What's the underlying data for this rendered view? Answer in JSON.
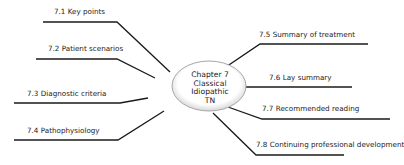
{
  "center": {
    "lines": [
      "Chapter 7",
      "Classical",
      "Idiopathic",
      "TN"
    ]
  },
  "branches": [
    {
      "label": "7.1 Key points"
    },
    {
      "label": "7.2 Patient scenarios"
    },
    {
      "label": "7.3 Diagnostic criteria"
    },
    {
      "label": "7.4 Pathophysiology"
    },
    {
      "label": "7.5 Summary of treatment"
    },
    {
      "label": "7.6 Lay summary"
    },
    {
      "label": "7.7 Recommended reading"
    },
    {
      "label": "7.8 Continuing professional development"
    }
  ],
  "colors": {
    "line": "#1a1a1a",
    "ellipse_fill": "#ffffff",
    "ellipse_edge": "#b0b0b0"
  }
}
